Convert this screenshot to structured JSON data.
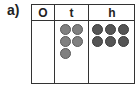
{
  "question": {
    "label": "a)"
  },
  "place_value_table": {
    "columns": [
      {
        "header": "O",
        "counters": 0
      },
      {
        "header": "t",
        "counters": 5
      },
      {
        "header": "h",
        "counters": 6
      }
    ],
    "colors": {
      "tens_counter": "#808080",
      "hundreds_counter": "#555555",
      "border": "#333333"
    }
  }
}
